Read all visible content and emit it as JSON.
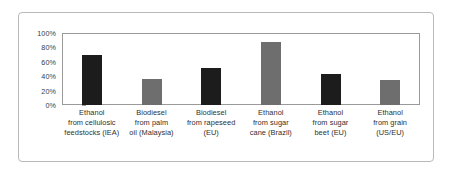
{
  "figure": {
    "frame_color": "#b9b9b9",
    "background": "#ffffff",
    "plot_border_color": "#9a9a9a"
  },
  "chart_data": {
    "type": "bar",
    "title": "",
    "subtitle": "",
    "xlabel": "",
    "ylabel": "",
    "ylim": [
      0,
      100
    ],
    "yticks": [
      0,
      20,
      40,
      60,
      80,
      100
    ],
    "ytick_labels": [
      "0%",
      "20%",
      "40%",
      "60%",
      "80%",
      "100%"
    ],
    "grid": false,
    "legend": "none",
    "unit": "%",
    "categories": [
      "Ethanol from cellulosic feedstocks (IEA)",
      "Biodiesel from palm oil (Malaysia)",
      "Biodiesel from rapeseed (EU)",
      "Ethanol from sugar cane (Brazil)",
      "Ethanol from sugar beet (EU)",
      "Ethanol from grain (US/EU)"
    ],
    "category_lines": [
      [
        "Ethanol",
        "from cellulosic",
        "feedstocks (IEA)"
      ],
      [
        "Biodiesel",
        "from palm",
        "oil (Malaysia)"
      ],
      [
        "Biodiesel",
        "from rapeseed",
        "(EU)"
      ],
      [
        "Ethanol",
        "from sugar",
        "cane (Brazil)"
      ],
      [
        "Ethanol",
        "from sugar",
        "beet (EU)"
      ],
      [
        "Ethanol",
        "from grain",
        "(US/EU)"
      ]
    ],
    "values": [
      70,
      36,
      52,
      88,
      43,
      35
    ],
    "bar_colors": [
      "#1c1c1c",
      "#6e6e6e",
      "#1c1c1c",
      "#6e6e6e",
      "#1c1c1c",
      "#6e6e6e"
    ]
  }
}
